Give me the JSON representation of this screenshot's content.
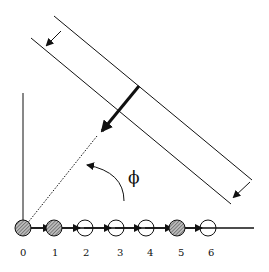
{
  "diagram": {
    "angle_label": "ϕ",
    "sites": [
      {
        "index": "0",
        "filled": true
      },
      {
        "index": "1",
        "filled": true
      },
      {
        "index": "2",
        "filled": false
      },
      {
        "index": "3",
        "filled": false
      },
      {
        "index": "4",
        "filled": false
      },
      {
        "index": "5",
        "filled": true
      },
      {
        "index": "6",
        "filled": false
      }
    ],
    "colors": {
      "ink": "#111111",
      "hatch": "#888888",
      "background": "#ffffff"
    }
  }
}
